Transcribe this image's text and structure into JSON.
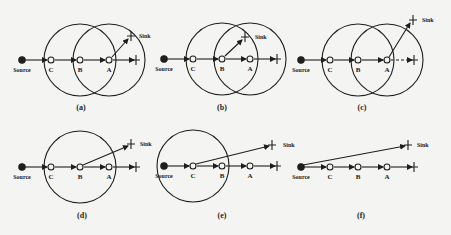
{
  "figure": {
    "colors": {
      "ink": "#1e1e1e",
      "background": "#f4f4f2"
    },
    "labels": {
      "source": "Source",
      "sink": "Sink",
      "node_c": "C",
      "node_b": "B",
      "node_a": "A"
    },
    "panels": [
      {
        "id": "a",
        "caption": "(a)",
        "circles_on": [
          "B",
          "A"
        ],
        "sink_from": "A"
      },
      {
        "id": "b",
        "caption": "(b)",
        "circles_on": [
          "B",
          "A"
        ],
        "sink_from": "B"
      },
      {
        "id": "c",
        "caption": "(c)",
        "circles_on": [
          "B",
          "A"
        ],
        "sink_from": "A"
      },
      {
        "id": "d",
        "caption": "(d)",
        "circles_on": [
          "B"
        ],
        "sink_from": "B"
      },
      {
        "id": "e",
        "caption": "(e)",
        "circles_on": [
          "C"
        ],
        "sink_from": "C"
      },
      {
        "id": "f",
        "caption": "(f)",
        "circles_on": [],
        "sink_from": "Source"
      }
    ]
  }
}
